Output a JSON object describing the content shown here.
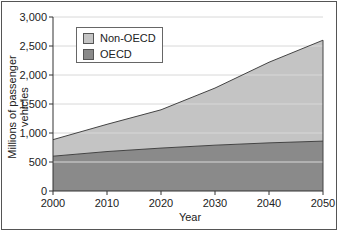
{
  "chart_data": {
    "type": "area",
    "stacked": true,
    "title": "",
    "xlabel": "Year",
    "ylabel": "Millions of passenger vehicles",
    "x": [
      2000,
      2010,
      2020,
      2030,
      2040,
      2050
    ],
    "series": [
      {
        "name": "OECD",
        "values": [
          600,
          680,
          740,
          790,
          830,
          860
        ],
        "color": "#8a8a8a"
      },
      {
        "name": "Non-OECD",
        "values": [
          285,
          470,
          660,
          985,
          1390,
          1740
        ],
        "color": "#c4c4c4"
      }
    ],
    "totals": [
      885,
      1150,
      1400,
      1775,
      2220,
      2600
    ],
    "yticks": [
      "0",
      "500",
      "1,000",
      "1,500",
      "2,000",
      "2,500",
      "3,000"
    ],
    "xticks": [
      "2000",
      "2010",
      "2020",
      "2030",
      "2040",
      "2050"
    ],
    "ylim": [
      0,
      3000
    ],
    "xlim": [
      2000,
      2050
    ],
    "grid": true,
    "legend_position": "upper left"
  },
  "legend": {
    "items": [
      {
        "label": "Non-OECD"
      },
      {
        "label": "OECD"
      }
    ]
  },
  "axes": {
    "xlabel": "Year",
    "ylabel": "Millions of passenger vehicles"
  }
}
